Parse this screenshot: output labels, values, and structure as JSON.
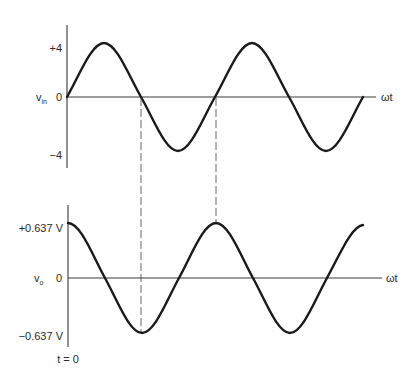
{
  "colors": {
    "background": "#ffffff",
    "waveform": "#1a1a1a",
    "axis": "#3a3a3a",
    "guide": "#555555",
    "text": "#2a2a2a"
  },
  "top_plot": {
    "signal_label": "v",
    "signal_subscript": "in",
    "y_ticks": {
      "pos": "+4",
      "zero": "0",
      "neg": "−4"
    },
    "x_label": "ωt",
    "waveform": "sine",
    "amplitude": 4,
    "cycles": 2
  },
  "bottom_plot": {
    "signal_label": "v",
    "signal_subscript": "o",
    "y_ticks": {
      "pos": "+0.637 V",
      "zero": "0",
      "neg": "−0.637 V"
    },
    "x_label": "ωt",
    "time_origin_label": "t = 0",
    "waveform": "cosine",
    "amplitude": 0.637,
    "cycles": 2
  },
  "guides": [
    {
      "description": "first input zero-crossing aligns with output minimum",
      "phase": "π"
    },
    {
      "description": "second input zero-crossing aligns with output maximum",
      "phase": "2π"
    }
  ]
}
